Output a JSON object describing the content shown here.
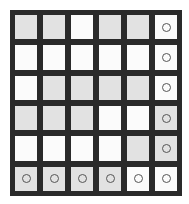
{
  "game": {
    "rows": 6,
    "cols": 6,
    "colors": {
      "grid_line": "#2a2a2a",
      "white_cell": "#fbfbfb",
      "gray_cell": "#e2e2e2",
      "marker": "#555555"
    },
    "cells": [
      [
        {
          "shade": "gray",
          "marker": false
        },
        {
          "shade": "gray",
          "marker": false
        },
        {
          "shade": "white",
          "marker": false
        },
        {
          "shade": "gray",
          "marker": false
        },
        {
          "shade": "gray",
          "marker": false
        },
        {
          "shade": "white",
          "marker": true
        }
      ],
      [
        {
          "shade": "white",
          "marker": false
        },
        {
          "shade": "white",
          "marker": false
        },
        {
          "shade": "white",
          "marker": false
        },
        {
          "shade": "white",
          "marker": false
        },
        {
          "shade": "white",
          "marker": false
        },
        {
          "shade": "white",
          "marker": true
        }
      ],
      [
        {
          "shade": "white",
          "marker": false
        },
        {
          "shade": "gray",
          "marker": false
        },
        {
          "shade": "gray",
          "marker": false
        },
        {
          "shade": "gray",
          "marker": false
        },
        {
          "shade": "gray",
          "marker": false
        },
        {
          "shade": "white",
          "marker": true
        }
      ],
      [
        {
          "shade": "gray",
          "marker": false
        },
        {
          "shade": "gray",
          "marker": false
        },
        {
          "shade": "gray",
          "marker": false
        },
        {
          "shade": "white",
          "marker": false
        },
        {
          "shade": "white",
          "marker": false
        },
        {
          "shade": "gray",
          "marker": true
        }
      ],
      [
        {
          "shade": "white",
          "marker": false
        },
        {
          "shade": "white",
          "marker": false
        },
        {
          "shade": "white",
          "marker": false
        },
        {
          "shade": "white",
          "marker": false
        },
        {
          "shade": "gray",
          "marker": false
        },
        {
          "shade": "gray",
          "marker": true
        }
      ],
      [
        {
          "shade": "gray",
          "marker": true
        },
        {
          "shade": "gray",
          "marker": true
        },
        {
          "shade": "gray",
          "marker": true
        },
        {
          "shade": "gray",
          "marker": true
        },
        {
          "shade": "white",
          "marker": true
        },
        {
          "shade": "white",
          "marker": true
        }
      ]
    ],
    "marker_icon": "circle-outline-icon"
  }
}
